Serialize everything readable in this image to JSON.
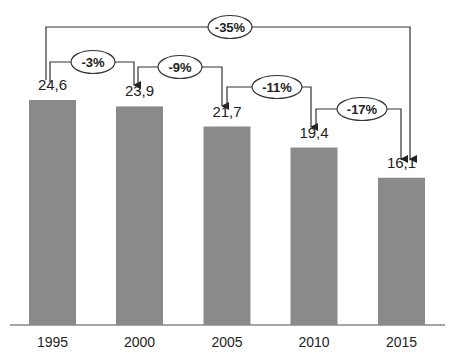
{
  "chart_data": {
    "type": "bar",
    "title": "",
    "xlabel": "",
    "ylabel": "",
    "categories": [
      "1995",
      "2000",
      "2005",
      "2010",
      "2015"
    ],
    "values": [
      24.6,
      23.9,
      21.7,
      19.4,
      16.1
    ],
    "value_labels": [
      "24,6",
      "23,9",
      "21,7",
      "19,4",
      "16,1"
    ],
    "ylim": [
      0,
      26
    ],
    "grid": false,
    "legend": null,
    "bar_color": "#8a8a8a",
    "annotations": [
      {
        "from": "1995",
        "to": "2000",
        "label": "-3%"
      },
      {
        "from": "2000",
        "to": "2005",
        "label": "-9%"
      },
      {
        "from": "2005",
        "to": "2010",
        "label": "-11%"
      },
      {
        "from": "2010",
        "to": "2015",
        "label": "-17%"
      },
      {
        "from": "1995",
        "to": "2015",
        "label": "-35%"
      }
    ]
  }
}
